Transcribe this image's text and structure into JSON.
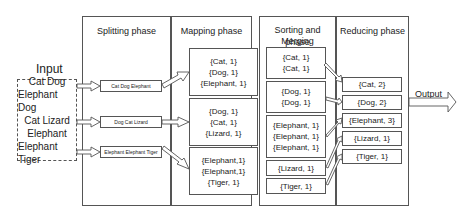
{
  "input": {
    "label": "Input",
    "lines": [
      "Cat Dog",
      "Elephant Dog",
      "Cat Lizard",
      "Elephant",
      "Elephant Tiger"
    ]
  },
  "phases": {
    "splitting": {
      "title": "Splitting phase",
      "splits": [
        "Cat Dog Elephant",
        "Dog Cat Lizard",
        "Elephant Elephant Tiger"
      ]
    },
    "mapping": {
      "title": "Mapping phase",
      "groups": [
        [
          "{Cat, 1}",
          "{Dog, 1}",
          "{Elephant, 1}"
        ],
        [
          "{Dog, 1}",
          "{Cat, 1}",
          "{Lizard, 1}"
        ],
        [
          "{Elephant,1}",
          "{Elephant,1}",
          "{Tiger, 1}"
        ]
      ]
    },
    "sorting": {
      "title_line1": "Sorting and Merging",
      "title_line2": "phase",
      "groups": [
        [
          "{Cat, 1}",
          "{Cat, 1}"
        ],
        [
          "{Dog, 1}",
          "{Dog, 1}"
        ],
        [
          "{Elephant, 1}",
          "{Elephant, 1}",
          "{Elephant, 1}"
        ],
        [
          "{Lizard, 1}"
        ],
        [
          "{Tiger, 1}"
        ]
      ]
    },
    "reducing": {
      "title": "Reducing phase",
      "results": [
        "{Cat, 2}",
        "{Dog, 2}",
        "{Elephant, 3}",
        "{Lizard, 1}",
        "{Tiger, 1}"
      ]
    }
  },
  "output": {
    "label": "Output"
  },
  "colors": {
    "stroke": "#555555",
    "text": "#222222",
    "background": "#ffffff"
  }
}
